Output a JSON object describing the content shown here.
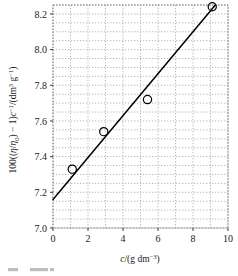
{
  "chart_data": {
    "type": "scatter",
    "title": "",
    "xlabel": "c/(g dm⁻³)",
    "ylabel": "100((η/η₀) − 1)c⁻¹/(dm³ g⁻¹)",
    "xlim": [
      0,
      10
    ],
    "ylim": [
      7.0,
      8.25
    ],
    "grid": true,
    "legend": "none",
    "x_ticks": [
      "0",
      "2",
      "4",
      "6",
      "8",
      "10"
    ],
    "x_tick_values": [
      0,
      2,
      4,
      6,
      8,
      10
    ],
    "x_minor_step": 1,
    "y_ticks": [
      "7.0",
      "7.2",
      "7.4",
      "7.6",
      "7.8",
      "8.0",
      "8.2"
    ],
    "y_tick_values": [
      7.0,
      7.2,
      7.4,
      7.6,
      7.8,
      8.0,
      8.2
    ],
    "y_minor_step": 0.05,
    "marker": "open-circle",
    "point_color": "#000000",
    "line_color": "#000000",
    "grid_color": "#a8a8a8",
    "x": [
      1.1,
      2.9,
      5.4,
      9.1
    ],
    "y": [
      7.33,
      7.54,
      7.72,
      8.24
    ],
    "points": [
      {
        "x": 1.1,
        "y": 7.33
      },
      {
        "x": 2.9,
        "y": 7.54
      },
      {
        "x": 5.4,
        "y": 7.72
      },
      {
        "x": 9.1,
        "y": 8.24
      }
    ],
    "fit_line": {
      "type": "linear",
      "intercept": 7.16,
      "slope": 0.1175,
      "x_start": 0,
      "x_end": 10
    }
  },
  "axis_labels": {
    "y_prefix": "100((",
    "y_eta": "η",
    "y_slash": "/",
    "y_eta0": "η",
    "y_eta0_sub": "0",
    "y_mid": ") − 1)",
    "y_c": "c",
    "y_c_sup": "−1",
    "y_unit_open": "/(dm",
    "y_unit_sup3": "3",
    "y_unit_g": " g",
    "y_unit_gsup": "−1",
    "y_unit_close": ")",
    "x_c": "c",
    "x_slash": "/(g dm",
    "x_sup": "−3",
    "x_close": ")"
  },
  "caption": {
    "text": ""
  }
}
